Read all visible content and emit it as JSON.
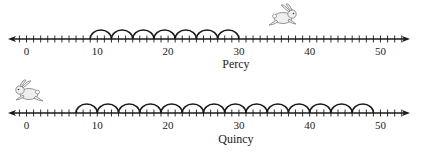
{
  "number_lines": [
    {
      "name": "Percy",
      "label": "Percy",
      "axis_y": 39,
      "label_y": 68,
      "tick_label_y": 55,
      "hop_start": 9,
      "hop_size": 3,
      "hop_count": 7,
      "hop_end": 30,
      "rabbit": {
        "x": 270,
        "y": 4,
        "facing": "right"
      }
    },
    {
      "name": "Quincy",
      "label": "Quincy",
      "axis_y": 113,
      "label_y": 143,
      "tick_label_y": 129,
      "hop_start": 7,
      "hop_size": 3,
      "hop_count": 14,
      "hop_end": 49,
      "rabbit": {
        "x": 14,
        "y": 80,
        "facing": "left"
      }
    }
  ],
  "axis": {
    "min": -3,
    "max": 55,
    "origin_px": 26.5,
    "px_per_unit": 7.08,
    "line_left_px": 8,
    "line_right_px": 410,
    "tick_step": 1,
    "labels": [
      "0",
      "10",
      "20",
      "30",
      "40",
      "50"
    ],
    "label_values": [
      0,
      10,
      20,
      30,
      40,
      50
    ]
  },
  "colors": {
    "line": "#1a1a1a",
    "text": "#222222",
    "rabbit_fill": "#efefef",
    "rabbit_stroke": "#8a8a8a"
  }
}
